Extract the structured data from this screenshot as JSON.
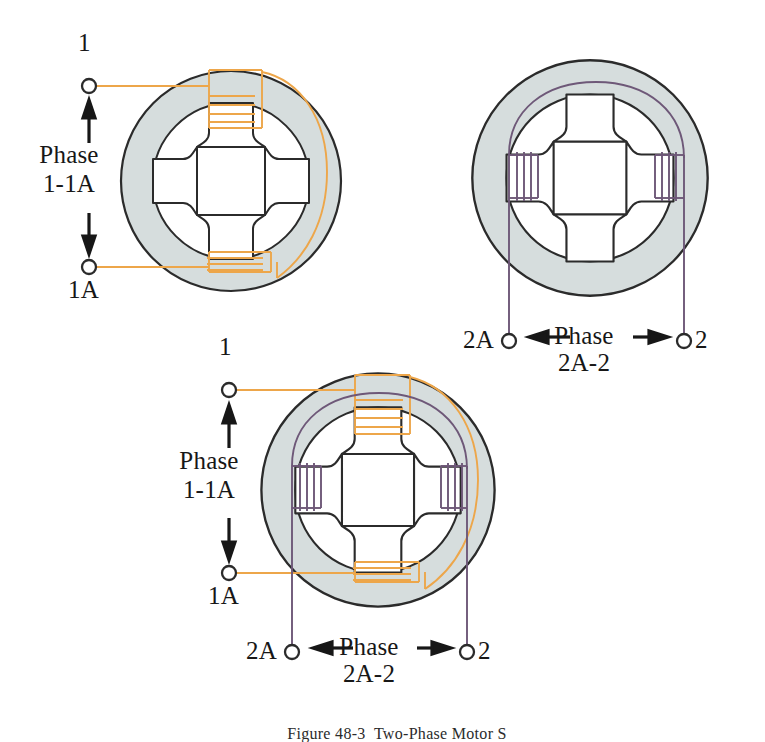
{
  "figure": {
    "caption": "Figure 48-3  Two-Phase Motor Stator",
    "colors": {
      "phase1_wire": "#eda64a",
      "phase2_wire": "#6e5878",
      "stator_fill": "#d5dcdd",
      "stator_outline": "#2b2b2b",
      "bore_fill": "#ffffff",
      "text": "#171717"
    }
  },
  "diagrams": [
    {
      "id": "top-left",
      "name": "phase-1-stator",
      "description": "Stator with Phase 1-1A winding only",
      "terminals": [
        {
          "label": "1",
          "name": "terminal-1",
          "x": 88,
          "y": 86
        },
        {
          "label": "1A",
          "name": "terminal-1a",
          "x": 88,
          "y": 267
        }
      ],
      "phase_label": {
        "line1": "Phase",
        "line2": "1-1A"
      },
      "poles": [
        "top",
        "bottom",
        "left",
        "right"
      ],
      "wound_poles": [
        "top",
        "bottom"
      ],
      "winding_color": "#eda64a"
    },
    {
      "id": "top-right",
      "name": "phase-2-stator",
      "description": "Stator with Phase 2A-2 winding only",
      "terminals": [
        {
          "label": "2A",
          "name": "terminal-2a",
          "x": 504,
          "y": 341
        },
        {
          "label": "2",
          "name": "terminal-2",
          "x": 690,
          "y": 341
        }
      ],
      "phase_label": {
        "line1": "Phase",
        "line2": "2A-2"
      },
      "poles": [
        "top",
        "bottom",
        "left",
        "right"
      ],
      "wound_poles": [
        "left",
        "right"
      ],
      "winding_color": "#6e5878"
    },
    {
      "id": "bottom",
      "name": "combined-two-phase-stator",
      "description": "Stator with both Phase 1-1A and Phase 2A-2 windings",
      "terminals": [
        {
          "label": "1",
          "name": "terminal-1",
          "x": 228,
          "y": 390
        },
        {
          "label": "1A",
          "name": "terminal-1a",
          "x": 228,
          "y": 573
        },
        {
          "label": "2A",
          "name": "terminal-2a",
          "x": 292,
          "y": 652
        },
        {
          "label": "2",
          "name": "terminal-2",
          "x": 470,
          "y": 652
        }
      ],
      "phase_labels": [
        {
          "line1": "Phase",
          "line2": "1-1A"
        },
        {
          "line1": "Phase",
          "line2": "2A-2"
        }
      ],
      "poles": [
        "top",
        "bottom",
        "left",
        "right"
      ],
      "wound_poles": [
        "top",
        "bottom",
        "left",
        "right"
      ],
      "winding_colors": [
        "#eda64a",
        "#6e5878"
      ]
    }
  ],
  "labels": {
    "tl_terminal_1": "1",
    "tl_terminal_1a": "1A",
    "tl_phase_line1": "Phase",
    "tl_phase_line2": "1-1A",
    "tr_terminal_2a": "2A",
    "tr_terminal_2": "2",
    "tr_phase_line1": "Phase",
    "tr_phase_line2": "2A-2",
    "bo_terminal_1": "1",
    "bo_terminal_1a": "1A",
    "bo_phase1_line1": "Phase",
    "bo_phase1_line2": "1-1A",
    "bo_terminal_2a": "2A",
    "bo_terminal_2": "2",
    "bo_phase2_line1": "Phase",
    "bo_phase2_line2": "2A-2",
    "caption": "Figure 48-3  Two-Phase Motor S"
  }
}
